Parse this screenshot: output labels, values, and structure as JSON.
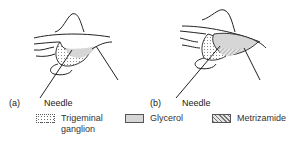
{
  "panels": [
    {
      "id": "a",
      "label": "(a)",
      "needle_label": "Needle"
    },
    {
      "id": "b",
      "label": "(b)",
      "needle_label": "Needle"
    }
  ],
  "legend": {
    "items": [
      {
        "key": "trigeminal-ganglion",
        "label_line1": "Trigeminal",
        "label_line2": "ganglion",
        "pattern": "dotted"
      },
      {
        "key": "glycerol",
        "label_line1": "Glycerol",
        "label_line2": "",
        "pattern": "light-gray-fill"
      },
      {
        "key": "metrizamide",
        "label_line1": "Metrizamide",
        "label_line2": "",
        "pattern": "diagonal-hatch"
      }
    ]
  },
  "colors": {
    "line": "#222222",
    "glycerol_fill": "#d6d6d6",
    "dot": "#555555",
    "hatch": "#666666"
  }
}
